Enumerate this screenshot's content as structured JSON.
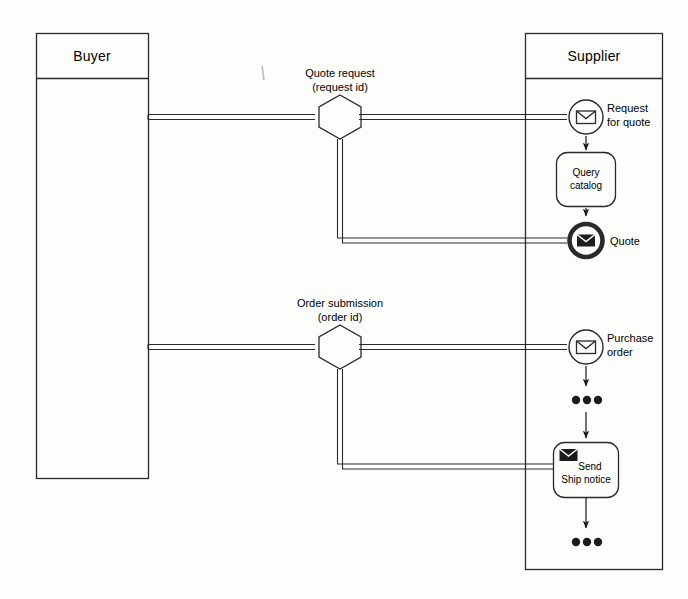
{
  "diagram": {
    "type": "bpmn-collaboration",
    "background_color": "#fdfdfc",
    "line_color": "#2a2a2a"
  },
  "pools": {
    "buyer": {
      "title": "Buyer"
    },
    "supplier": {
      "title": "Supplier"
    }
  },
  "message_flows": [
    {
      "id": "quote-request",
      "label_line1": "Quote request",
      "label_line2": "(request id)"
    },
    {
      "id": "order-submission",
      "label_line1": "Order submission",
      "label_line2": "(order id)"
    }
  ],
  "supplier_nodes": {
    "request_for_quote": {
      "label_line1": "Request",
      "label_line2": "for quote",
      "icon": "envelope-icon",
      "event_type": "message-start-event"
    },
    "query_catalog": {
      "label_line1": "Query",
      "label_line2": "catalog",
      "node_type": "task"
    },
    "quote": {
      "label_line1": "Quote",
      "icon": "envelope-filled-icon",
      "event_type": "message-end-event"
    },
    "purchase_order": {
      "label_line1": "Purchase",
      "label_line2": "order",
      "icon": "envelope-icon",
      "event_type": "message-start-event"
    },
    "send_ship_notice": {
      "label_line1": "Send",
      "label_line2": "Ship notice",
      "icon": "envelope-filled-icon",
      "node_type": "send-task"
    },
    "ellipsis_upper": {
      "label": "continuation-dots"
    },
    "ellipsis_lower": {
      "label": "continuation-dots"
    }
  }
}
